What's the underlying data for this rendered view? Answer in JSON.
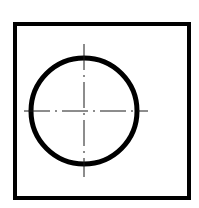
{
  "diagram": {
    "type": "technical-drawing",
    "colors": {
      "background": "#ffffff",
      "stroke": "#000000",
      "centerline": "#1a1a1a"
    },
    "frame": {
      "x": 15,
      "y": 24,
      "width": 174,
      "height": 174,
      "stroke_width": 4
    },
    "circle": {
      "cx": 84,
      "cy": 111,
      "r": 53,
      "stroke_width": 5
    },
    "centerlines": {
      "horizontal": {
        "x1": 24,
        "x2": 148,
        "y": 111
      },
      "vertical": {
        "x": 84,
        "y1": 44,
        "y2": 177
      },
      "dash_pattern": "26 5 2 5",
      "stroke_width": 1
    }
  }
}
